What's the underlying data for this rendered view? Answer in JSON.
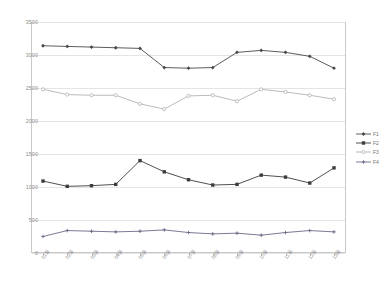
{
  "chart_data": {
    "type": "line",
    "title": "",
    "xlabel": "",
    "ylabel": "",
    "ylim": [
      0,
      3500
    ],
    "yticks": [
      0,
      500,
      1000,
      1500,
      2000,
      2500,
      3000,
      3500
    ],
    "ytick_labels": [
      "0",
      "500",
      "1000",
      "1500",
      "2000",
      "2500",
      "3000",
      "3500"
    ],
    "grid": true,
    "legend_position": "right",
    "categories": [
      "01월",
      "02월",
      "03월",
      "04월",
      "05월",
      "06월",
      "07월",
      "08월",
      "09월",
      "10월",
      "11월",
      "12월",
      "13월"
    ],
    "series": [
      {
        "name": "F1",
        "color": "#4a4a4a",
        "marker": "diamond",
        "values": [
          3140,
          3130,
          3120,
          3110,
          3100,
          2810,
          2800,
          2810,
          3040,
          3070,
          3040,
          2980,
          2800
        ]
      },
      {
        "name": "F2",
        "color": "#3c3c3c",
        "marker": "square",
        "values": [
          1090,
          1010,
          1020,
          1040,
          1400,
          1230,
          1110,
          1030,
          1040,
          1180,
          1150,
          1060,
          1290
        ]
      },
      {
        "name": "F3",
        "color": "#b3b3b3",
        "marker": "circle",
        "values": [
          2480,
          2400,
          2390,
          2390,
          2260,
          2180,
          2380,
          2390,
          2300,
          2480,
          2440,
          2390,
          2330
        ]
      },
      {
        "name": "F4",
        "color": "#6b6b8a",
        "marker": "plus",
        "values": [
          250,
          340,
          330,
          320,
          330,
          350,
          310,
          290,
          300,
          270,
          310,
          340,
          320
        ]
      }
    ]
  },
  "legend": {
    "items": [
      {
        "label": "F1"
      },
      {
        "label": "F2"
      },
      {
        "label": "F3"
      },
      {
        "label": "F4"
      }
    ]
  }
}
